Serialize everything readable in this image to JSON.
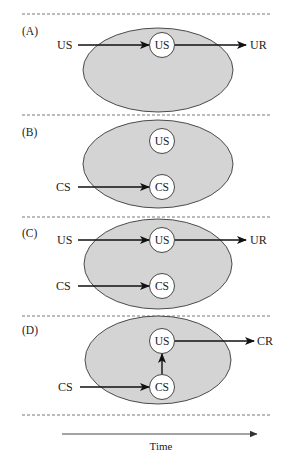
{
  "colors": {
    "ellipse_fill": "#d4d4d4",
    "ellipse_stroke": "#3a3a3a",
    "node_fill": "#ffffff",
    "arrow": "#111111",
    "divider": "#555555"
  },
  "panels": [
    {
      "id": "A",
      "label": "(A)",
      "inputs": [
        {
          "text": "US",
          "target": "US"
        }
      ],
      "nodes": [
        "US"
      ],
      "outputs": [
        {
          "from": "US",
          "text": "UR"
        }
      ]
    },
    {
      "id": "B",
      "label": "(B)",
      "inputs": [
        {
          "text": "CS",
          "target": "CS"
        }
      ],
      "nodes": [
        "US",
        "CS"
      ],
      "outputs": []
    },
    {
      "id": "C",
      "label": "(C)",
      "inputs": [
        {
          "text": "US",
          "target": "US"
        },
        {
          "text": "CS",
          "target": "CS"
        }
      ],
      "nodes": [
        "US",
        "CS"
      ],
      "outputs": [
        {
          "from": "US",
          "text": "UR"
        }
      ]
    },
    {
      "id": "D",
      "label": "(D)",
      "inputs": [
        {
          "text": "CS",
          "target": "CS"
        }
      ],
      "nodes": [
        "US",
        "CS"
      ],
      "links": [
        {
          "from": "CS",
          "to": "US"
        }
      ],
      "outputs": [
        {
          "from": "US",
          "text": "CR"
        }
      ]
    }
  ],
  "time_axis": {
    "label": "Time"
  }
}
